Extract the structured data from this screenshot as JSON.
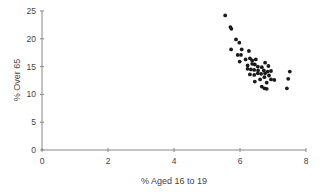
{
  "chart_data": {
    "type": "scatter",
    "title": "",
    "xlabel": "% Aged 16 to 19",
    "ylabel": "% Over 65",
    "xlim": [
      0,
      8
    ],
    "ylim": [
      0,
      25
    ],
    "xticks": [
      0,
      2,
      4,
      6,
      8
    ],
    "yticks": [
      0,
      5,
      10,
      15,
      20,
      25
    ],
    "grid": false,
    "legend": null,
    "series": [
      {
        "name": "",
        "points": [
          [
            5.55,
            24.2
          ],
          [
            5.71,
            22.1
          ],
          [
            5.74,
            21.8
          ],
          [
            5.88,
            19.9
          ],
          [
            5.98,
            19.3
          ],
          [
            5.73,
            18.1
          ],
          [
            6.05,
            18.1
          ],
          [
            6.27,
            17.8
          ],
          [
            5.93,
            17.1
          ],
          [
            6.03,
            17.1
          ],
          [
            5.99,
            15.9
          ],
          [
            6.17,
            16.3
          ],
          [
            6.3,
            16.5
          ],
          [
            6.37,
            16.1
          ],
          [
            6.48,
            16.3
          ],
          [
            6.23,
            15.2
          ],
          [
            6.37,
            15.5
          ],
          [
            6.45,
            15.4
          ],
          [
            6.76,
            15.7
          ],
          [
            6.86,
            15.1
          ],
          [
            6.23,
            14.6
          ],
          [
            6.33,
            14.5
          ],
          [
            6.54,
            15.0
          ],
          [
            6.66,
            14.9
          ],
          [
            6.43,
            14.4
          ],
          [
            6.55,
            14.3
          ],
          [
            6.72,
            14.3
          ],
          [
            6.84,
            14.1
          ],
          [
            6.94,
            14.2
          ],
          [
            6.3,
            13.6
          ],
          [
            6.43,
            13.5
          ],
          [
            6.54,
            13.8
          ],
          [
            6.64,
            13.7
          ],
          [
            6.76,
            13.8
          ],
          [
            6.88,
            13.4
          ],
          [
            6.74,
            13.1
          ],
          [
            6.61,
            12.7
          ],
          [
            6.94,
            12.7
          ],
          [
            7.04,
            12.6
          ],
          [
            6.45,
            12.3
          ],
          [
            6.81,
            12.1
          ],
          [
            6.66,
            11.4
          ],
          [
            6.74,
            11.1
          ],
          [
            6.81,
            11.0
          ],
          [
            7.51,
            14.1
          ],
          [
            7.46,
            12.8
          ],
          [
            7.42,
            11.1
          ]
        ]
      }
    ]
  },
  "colors": {
    "point": "#1a1a1a",
    "axis": "#888888",
    "text": "#444444"
  }
}
